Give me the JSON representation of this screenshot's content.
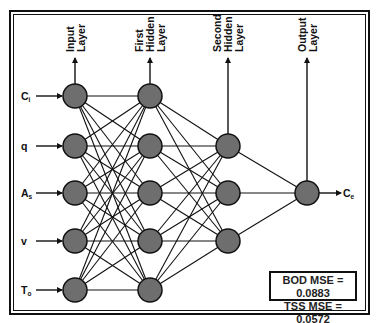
{
  "layers": [
    {
      "name": "Input Layer",
      "label_lines": [
        "Input",
        "Layer"
      ],
      "x": 75,
      "nodes_y": [
        96,
        146,
        193,
        241,
        290
      ]
    },
    {
      "name": "First Hidden Layer",
      "label_lines": [
        "First",
        "Hidden",
        "Layer"
      ],
      "x": 150,
      "nodes_y": [
        96,
        146,
        193,
        241,
        290
      ]
    },
    {
      "name": "Second Hidden Layer",
      "label_lines": [
        "Second",
        "Hidden",
        "Layer"
      ],
      "x": 228,
      "nodes_y": [
        146,
        193,
        241
      ]
    },
    {
      "name": "Output Layer",
      "label_lines": [
        "Output",
        "Layer"
      ],
      "x": 307,
      "nodes_y": [
        193
      ]
    }
  ],
  "inputs": [
    {
      "base": "C",
      "sub": "i"
    },
    {
      "base": "q",
      "sub": ""
    },
    {
      "base": "A",
      "sub": "s"
    },
    {
      "base": "v",
      "sub": ""
    },
    {
      "base": "T",
      "sub": "o"
    }
  ],
  "output": {
    "base": "C",
    "sub": "e"
  },
  "metrics": {
    "line1": "BOD MSE = 0.0883",
    "line2": "TSS MSE = 0.0572"
  },
  "colors": {
    "node_fill": "#6e6e6e",
    "stroke": "#111111"
  }
}
